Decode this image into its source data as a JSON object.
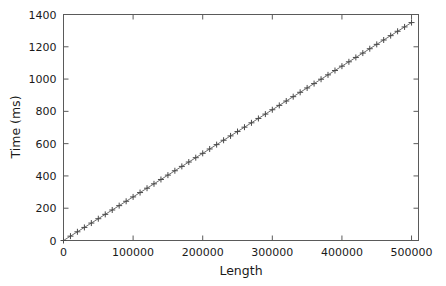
{
  "chart_data": {
    "type": "line",
    "title": "",
    "xlabel": "Length",
    "ylabel": "Time (ms)",
    "xlim": [
      0,
      510000
    ],
    "ylim": [
      0,
      1400
    ],
    "grid": false,
    "legend": null,
    "marker": "plus",
    "line_color": "#6f6f6f",
    "marker_color": "#4a4a4a",
    "xticks": [
      0,
      100000,
      200000,
      300000,
      400000,
      500000
    ],
    "xtick_labels": [
      "0",
      "100000",
      "200000",
      "300000",
      "400000",
      "500000"
    ],
    "yticks": [
      0,
      200,
      400,
      600,
      800,
      1000,
      1200,
      1400
    ],
    "ytick_labels": [
      "0",
      "200",
      "400",
      "600",
      "800",
      "1000",
      "1200",
      "1400"
    ],
    "series": [
      {
        "name": "Time vs Length",
        "x": [
          0,
          10000,
          20000,
          30000,
          40000,
          50000,
          60000,
          70000,
          80000,
          90000,
          100000,
          110000,
          120000,
          130000,
          140000,
          150000,
          160000,
          170000,
          180000,
          190000,
          200000,
          210000,
          220000,
          230000,
          240000,
          250000,
          260000,
          270000,
          280000,
          290000,
          300000,
          310000,
          320000,
          330000,
          340000,
          350000,
          360000,
          370000,
          380000,
          390000,
          400000,
          410000,
          420000,
          430000,
          440000,
          450000,
          460000,
          470000,
          480000,
          490000,
          500000
        ],
        "y": [
          0,
          27,
          54,
          81,
          108,
          135,
          162,
          189,
          216,
          243,
          270,
          297,
          324,
          351,
          378,
          405,
          432,
          459,
          486,
          513,
          540,
          567,
          594,
          621,
          648,
          675,
          702,
          729,
          756,
          783,
          810,
          837,
          864,
          891,
          918,
          945,
          972,
          999,
          1026,
          1053,
          1080,
          1107,
          1134,
          1161,
          1188,
          1215,
          1242,
          1269,
          1296,
          1323,
          1350
        ]
      }
    ]
  },
  "axes": {
    "xlabel": "Length",
    "ylabel": "Time (ms)"
  }
}
